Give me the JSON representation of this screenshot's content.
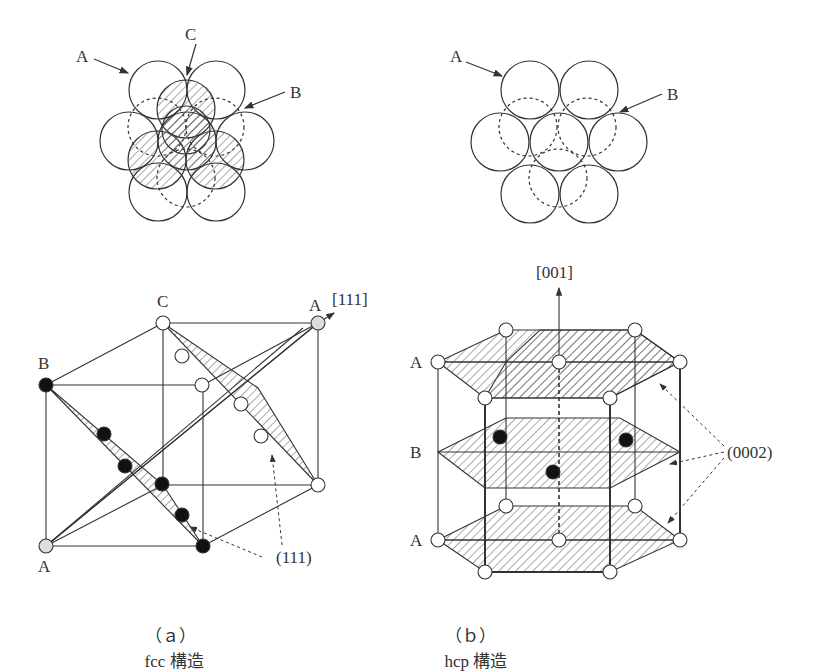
{
  "figure": {
    "panel_a": {
      "caption_index": "（ａ）",
      "caption_text": "fcc 構造",
      "top_view_labels": {
        "a": "A",
        "b": "B",
        "c": "C"
      },
      "cube_labels": {
        "c_top": "C",
        "a_top": "A",
        "b_left": "B",
        "a_bottom": "A"
      },
      "direction": "[111]",
      "plane": "(111)"
    },
    "panel_b": {
      "caption_index": "（ｂ）",
      "caption_text": "hcp 構造",
      "top_view_labels": {
        "a": "A",
        "b": "B"
      },
      "layer_labels": {
        "top": "A",
        "middle": "B",
        "bottom": "A"
      },
      "direction": "[001]",
      "plane": "(0002)"
    },
    "colors": {
      "line": "#333333",
      "hatch": "#555555",
      "atom_fill": "#ffffff",
      "atom_black": "#111111",
      "atom_grey": "#dddddd"
    }
  }
}
